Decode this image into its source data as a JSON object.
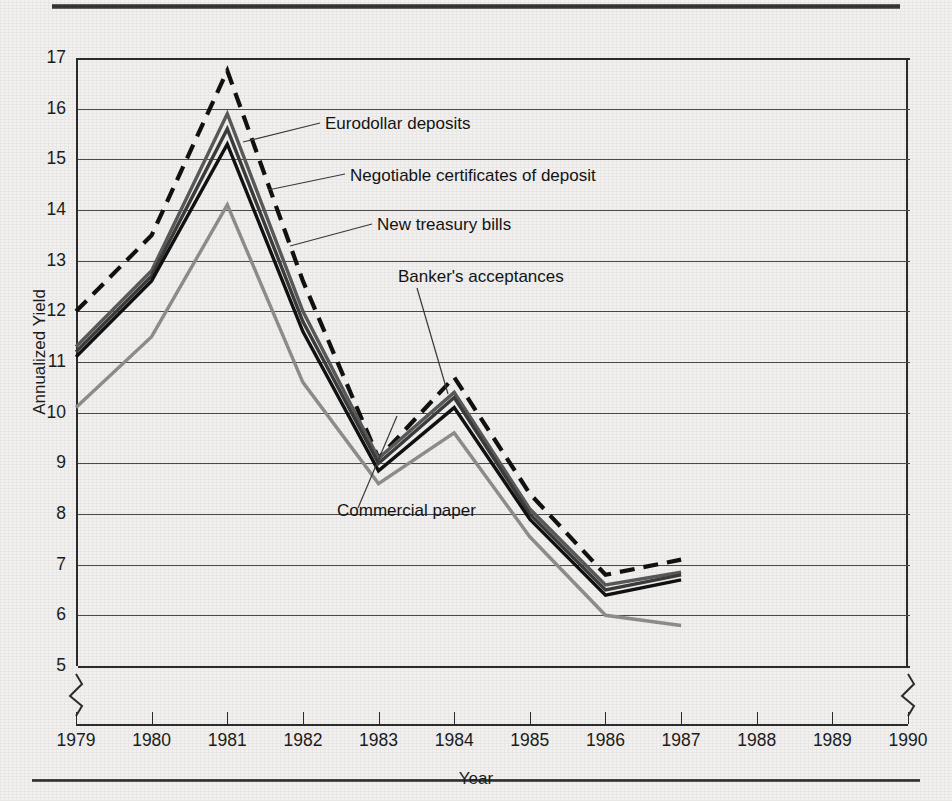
{
  "figure": {
    "axis_title_y": "Annualized Yield",
    "axis_title_x": "Year"
  },
  "annotations": [
    {
      "id": "eurodollar",
      "text": "Eurodollar deposits"
    },
    {
      "id": "ncd",
      "text": "Negotiable  certificates of deposit"
    },
    {
      "id": "tbills",
      "text": "New treasury bills"
    },
    {
      "id": "bankers",
      "text": "Banker's acceptances"
    },
    {
      "id": "commercial",
      "text": "Commercial paper"
    }
  ],
  "colors": {
    "grid": "#4a4a4a",
    "axis": "#2c2c2c",
    "eurodollar": "#111111",
    "ncd": "#5a5a5a",
    "bankers": "#3c3c3c",
    "tbills": "#111111",
    "commercial": "#8e8e8e",
    "page_background": "#f2f1ef"
  },
  "chart_data": {
    "type": "line",
    "title": "",
    "xlabel": "Year",
    "ylabel": "Annualized Yield",
    "x": [
      1979,
      1980,
      1981,
      1982,
      1983,
      1984,
      1985,
      1986,
      1987
    ],
    "xlim": [
      1979,
      1990
    ],
    "ylim": [
      5,
      17
    ],
    "xticks": [
      1979,
      1980,
      1981,
      1982,
      1983,
      1984,
      1985,
      1986,
      1987,
      1988,
      1989,
      1990
    ],
    "yticks": [
      5,
      6,
      7,
      8,
      9,
      10,
      11,
      12,
      13,
      14,
      15,
      16,
      17
    ],
    "grid": true,
    "legend": "inline-annotations",
    "axis_breaks": [
      "y-below-5-left",
      "y-below-5-right"
    ],
    "series": [
      {
        "name": "Eurodollar deposits",
        "style": "dashed",
        "color": "#111111",
        "values": [
          12.0,
          13.5,
          16.75,
          12.6,
          9.1,
          10.7,
          8.4,
          6.8,
          7.1
        ]
      },
      {
        "name": "Negotiable certificates of deposit",
        "style": "solid",
        "color": "#5a5a5a",
        "values": [
          11.3,
          12.8,
          15.9,
          12.0,
          9.1,
          10.4,
          8.1,
          6.6,
          6.85
        ]
      },
      {
        "name": "Banker's acceptances",
        "style": "solid",
        "color": "#3c3c3c",
        "values": [
          11.2,
          12.7,
          15.6,
          11.8,
          9.0,
          10.3,
          8.0,
          6.5,
          6.8
        ]
      },
      {
        "name": "New treasury bills",
        "style": "solid",
        "color": "#111111",
        "values": [
          11.1,
          12.6,
          15.3,
          11.6,
          8.85,
          10.1,
          7.9,
          6.4,
          6.7
        ]
      },
      {
        "name": "Commercial paper",
        "style": "solid",
        "color": "#8e8e8e",
        "values": [
          10.1,
          11.5,
          14.1,
          10.6,
          8.6,
          9.6,
          7.55,
          6.0,
          5.8
        ]
      }
    ]
  }
}
